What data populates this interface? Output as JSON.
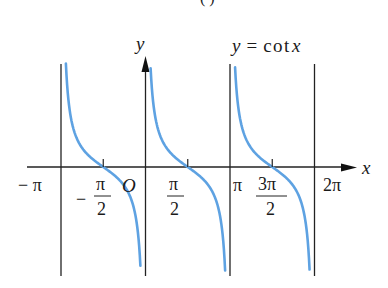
{
  "figure": {
    "top_fragment": "( )",
    "function_label": "y = cot x"
  },
  "axes": {
    "x_label": "x",
    "y_label": "y",
    "origin_label": "O"
  },
  "ticks": [
    {
      "id": "neg-pi",
      "value": -3.14159,
      "label": "− π",
      "type": "plain"
    },
    {
      "id": "neg-half-pi",
      "value": -1.5708,
      "label_num": "π",
      "label_den": "2",
      "sign": "−",
      "type": "frac"
    },
    {
      "id": "half-pi",
      "value": 1.5708,
      "label_num": "π",
      "label_den": "2",
      "sign": "",
      "type": "frac"
    },
    {
      "id": "pi",
      "value": 3.14159,
      "label": "π",
      "type": "plain"
    },
    {
      "id": "three-half-pi",
      "value": 4.7124,
      "label_num": "3π",
      "label_den": "2",
      "sign": "",
      "type": "frac"
    },
    {
      "id": "two-pi",
      "value": 6.28318,
      "label": "2π",
      "type": "plain"
    }
  ],
  "colors": {
    "curve": "#5ea2e2",
    "axis": "#222222",
    "asymptote": "#222222"
  },
  "chart_data": {
    "type": "line",
    "xlabel": "x",
    "ylabel": "y",
    "xlim": [
      -3.93,
      7.72
    ],
    "ylim": [
      -5.3,
      5.3
    ],
    "grid": false,
    "legend": null,
    "asymptotes_x": [
      -3.14159,
      0,
      3.14159,
      6.28318
    ],
    "x_tick_labels": [
      "−π",
      "−π/2",
      "O",
      "π/2",
      "π",
      "3π/2",
      "2π"
    ],
    "series": [
      {
        "name": "cot x on (−π, 0)",
        "x_range": [
          -2.96,
          -0.19
        ],
        "zeros": [
          -1.5708
        ]
      },
      {
        "name": "cot x on (0, π)",
        "x_range": [
          0.19,
          2.96
        ],
        "zeros": [
          1.5708
        ]
      },
      {
        "name": "cot x on (π, 2π)",
        "x_range": [
          3.33,
          6.1
        ],
        "zeros": [
          4.7124
        ]
      }
    ],
    "sample_points": [
      {
        "x": -2.96,
        "y": 5.3
      },
      {
        "x": -2.356,
        "y": 1.0
      },
      {
        "x": -1.5708,
        "y": 0
      },
      {
        "x": -0.785,
        "y": -1.0
      },
      {
        "x": -0.19,
        "y": -5.2
      },
      {
        "x": 0.19,
        "y": 5.2
      },
      {
        "x": 0.785,
        "y": 1.0
      },
      {
        "x": 1.5708,
        "y": 0
      },
      {
        "x": 2.356,
        "y": -1.0
      },
      {
        "x": 2.96,
        "y": -5.3
      },
      {
        "x": 3.33,
        "y": 5.2
      },
      {
        "x": 3.927,
        "y": 1.0
      },
      {
        "x": 4.7124,
        "y": 0
      },
      {
        "x": 5.498,
        "y": -1.0
      },
      {
        "x": 6.1,
        "y": -5.3
      }
    ]
  }
}
